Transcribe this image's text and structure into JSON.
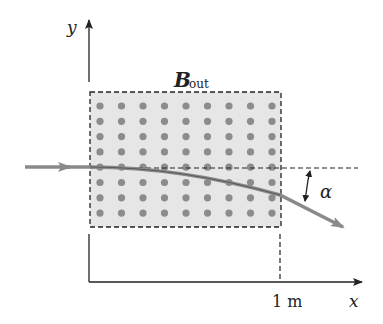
{
  "figure": {
    "axis_y_label": "y",
    "axis_x_label": "x",
    "field_label_main": "B",
    "field_label_sub": "out",
    "angle_label": "α",
    "distance_label": "1 m"
  },
  "field_region": {
    "rows": 8,
    "columns": 9,
    "fill_color": "#e6e6e6",
    "dot_color": "#8c8c8c",
    "border_style": "dashed"
  },
  "ray": {
    "color": "#8a8a8a",
    "description": "particle path deflected downward by angle alpha"
  }
}
